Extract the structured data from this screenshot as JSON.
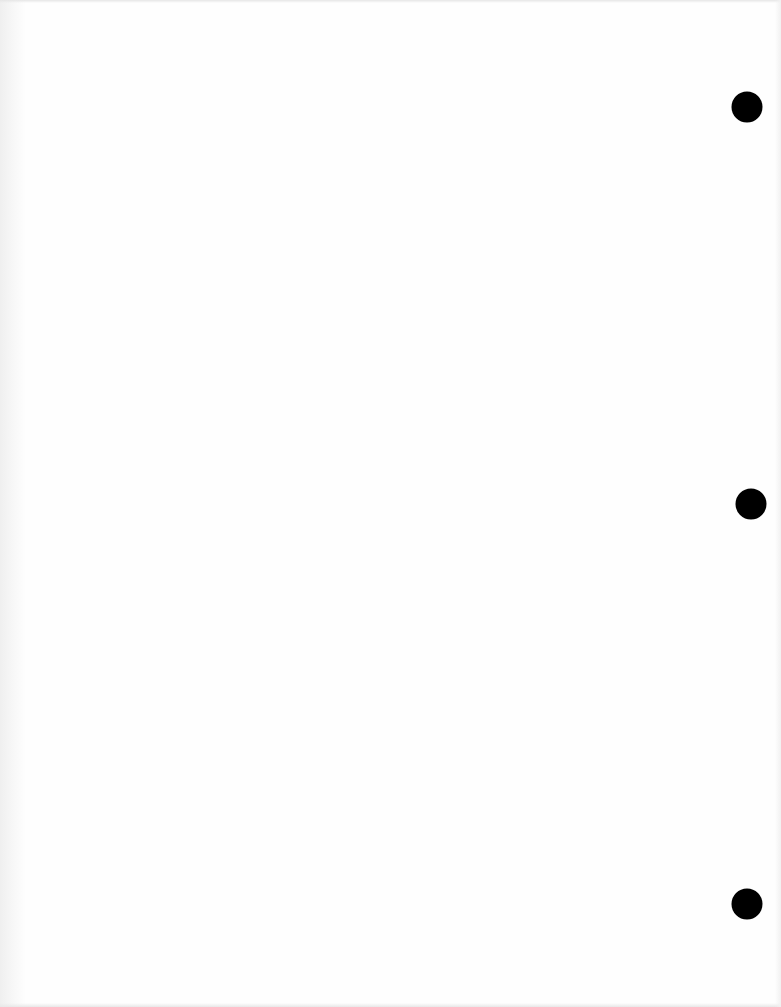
{
  "page": {
    "type": "blank three-hole punched sheet",
    "background_color": "#fefefe",
    "content_text": ""
  },
  "holes": [
    {
      "name": "punch-hole-top",
      "cx": 747,
      "cy": 107,
      "diameter": 31,
      "color": "#000000"
    },
    {
      "name": "punch-hole-middle",
      "cx": 751,
      "cy": 504,
      "diameter": 31,
      "color": "#000000"
    },
    {
      "name": "punch-hole-bottom",
      "cx": 747,
      "cy": 904,
      "diameter": 31,
      "color": "#000000"
    }
  ]
}
